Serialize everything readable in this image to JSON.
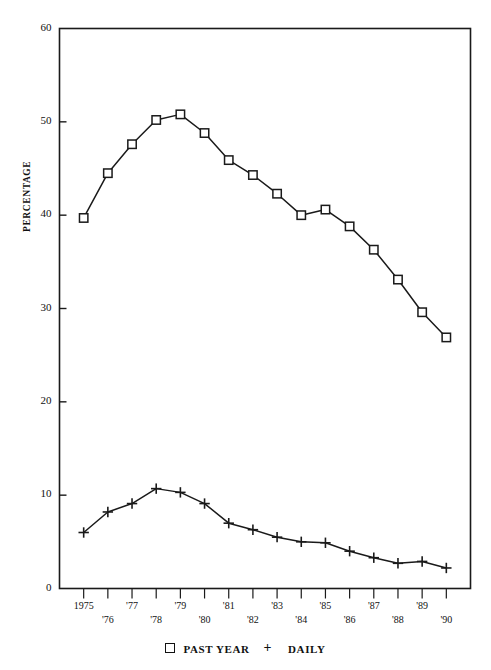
{
  "figure": {
    "top_caption": "",
    "ylabel": "PERCENTAGE"
  },
  "axes": {
    "y_ticks": [
      "0",
      "10",
      "20",
      "30",
      "40",
      "50",
      "60"
    ],
    "x_ticks_upper": [
      "1975",
      "'77",
      "'79",
      "'81",
      "'83",
      "'85",
      "'87",
      "'89"
    ],
    "x_ticks_lower": [
      "'76",
      "'78",
      "'80",
      "'82",
      "'84",
      "'86",
      "'88",
      "'90"
    ]
  },
  "legend": {
    "square_marker": "□",
    "series1_label": "PAST YEAR",
    "plus_marker": "+",
    "series2_label": "DAILY"
  },
  "colors": {
    "line": "#1a1a1a",
    "axis": "#1a1a1a",
    "background": "#ffffff"
  },
  "chart_data": {
    "type": "line",
    "title": "",
    "xlabel": "",
    "ylabel": "PERCENTAGE",
    "ylim": [
      0,
      60
    ],
    "ytick_step": 10,
    "grid": false,
    "legend_position": "bottom",
    "x": [
      1975,
      1976,
      1977,
      1978,
      1979,
      1980,
      1981,
      1982,
      1983,
      1984,
      1985,
      1986,
      1987,
      1988,
      1989,
      1990
    ],
    "xtick_labels": [
      "1975",
      "'76",
      "'77",
      "'78",
      "'79",
      "'80",
      "'81",
      "'82",
      "'83",
      "'84",
      "'85",
      "'86",
      "'87",
      "'88",
      "'89",
      "'90"
    ],
    "series": [
      {
        "name": "PAST YEAR",
        "marker": "square",
        "values": [
          39.7,
          44.5,
          47.6,
          50.2,
          50.8,
          48.8,
          45.9,
          44.3,
          42.3,
          40.0,
          40.6,
          38.8,
          36.3,
          33.1,
          29.6,
          26.9
        ]
      },
      {
        "name": "DAILY",
        "marker": "plus",
        "values": [
          6.0,
          8.2,
          9.1,
          10.7,
          10.3,
          9.1,
          7.0,
          6.3,
          5.5,
          5.0,
          4.9,
          4.0,
          3.3,
          2.7,
          2.9,
          2.2
        ]
      }
    ]
  }
}
